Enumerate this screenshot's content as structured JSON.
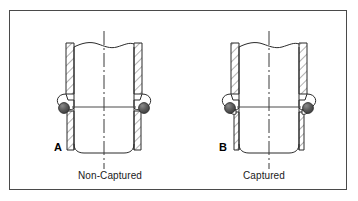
{
  "figure": {
    "background_color": "#ffffff",
    "frame_color": "#4a4a4a",
    "line_color": "#2b2b2b",
    "hatch_color": "#555555",
    "oring_color": "#4a4a4a",
    "oring_highlight_color": "#8a8a8a",
    "centerline_color": "#3a3a3a",
    "width": 358,
    "height": 201
  },
  "panels": [
    {
      "id": "panel-a",
      "letter": "A",
      "caption": "Non-Captured",
      "description": "Cross-section of a tube end with an O-ring seated in an open, non-captured groove on each wall",
      "oring_count": 2,
      "groove_type": "non-captured"
    },
    {
      "id": "panel-b",
      "letter": "B",
      "caption": "Captured",
      "description": "Cross-section of a tube end with an O-ring seated in a closed, captured groove on each wall",
      "oring_count": 2,
      "groove_type": "captured"
    }
  ],
  "annotations": {
    "centerline_style": "dash-dot",
    "break_line_style": "wavy-short-break",
    "section_fill": "diagonal-hatch"
  }
}
